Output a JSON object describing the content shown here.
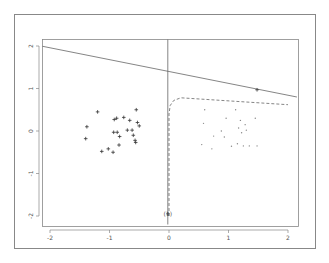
{
  "chart_data": {
    "type": "scatter",
    "title": "",
    "xlabel": "",
    "ylabel": "",
    "xlim": [
      -2.15,
      2.15
    ],
    "ylim": [
      -2.2,
      2.2
    ],
    "grid": false,
    "legend": null,
    "x_ticks": [
      -2,
      -1,
      0,
      1,
      2
    ],
    "x_tick_labels": [
      "-2",
      "-1",
      "0",
      "1",
      "2"
    ],
    "y_ticks": [
      -2,
      -1,
      0,
      1,
      2
    ],
    "y_tick_labels": [
      "-2",
      "-1",
      "0",
      "1",
      "2"
    ],
    "series": [
      {
        "name": "class-1",
        "marker": "plus",
        "color": "#333333",
        "points": [
          [
            -1.2,
            0.45
          ],
          [
            -1.38,
            0.1
          ],
          [
            -1.4,
            -0.18
          ],
          [
            -0.92,
            0.27
          ],
          [
            -0.88,
            0.3
          ],
          [
            -0.76,
            0.32
          ],
          [
            -0.66,
            0.25
          ],
          [
            -0.55,
            0.5
          ],
          [
            -0.53,
            0.2
          ],
          [
            -0.5,
            0.12
          ],
          [
            -0.93,
            -0.03
          ],
          [
            -0.87,
            -0.03
          ],
          [
            -0.83,
            -0.13
          ],
          [
            -0.7,
            0.02
          ],
          [
            -0.62,
            0.02
          ],
          [
            -0.6,
            -0.1
          ],
          [
            -0.57,
            -0.22
          ],
          [
            -0.56,
            -0.27
          ],
          [
            -1.13,
            -0.48
          ],
          [
            -1.02,
            -0.42
          ],
          [
            -0.94,
            -0.5
          ],
          [
            -0.84,
            -0.33
          ]
        ]
      },
      {
        "name": "class-2",
        "marker": "dot",
        "color": "#888888",
        "points": [
          [
            0.6,
            0.5
          ],
          [
            0.58,
            0.18
          ],
          [
            0.55,
            -0.32
          ],
          [
            0.72,
            -0.42
          ],
          [
            0.96,
            0.3
          ],
          [
            0.88,
            0.0
          ],
          [
            0.93,
            -0.14
          ],
          [
            1.12,
            0.5
          ],
          [
            1.2,
            0.25
          ],
          [
            1.17,
            0.07
          ],
          [
            1.22,
            -0.04
          ],
          [
            1.28,
            0.15
          ],
          [
            1.3,
            0.02
          ],
          [
            1.35,
            -0.35
          ],
          [
            1.25,
            -0.35
          ],
          [
            1.15,
            -0.3
          ],
          [
            1.05,
            -0.36
          ],
          [
            0.75,
            -0.12
          ],
          [
            1.45,
            0.3
          ],
          [
            1.48,
            -0.35
          ]
        ]
      },
      {
        "name": "special-points",
        "marker": "plus",
        "color": "#333333",
        "points": [
          [
            1.48,
            0.97
          ],
          [
            -0.02,
            -1.95
          ]
        ]
      }
    ],
    "lines": [
      {
        "name": "solid-boundary",
        "style": "solid",
        "color": "#666666",
        "points": [
          [
            -2.15,
            2.0
          ],
          [
            2.15,
            0.8
          ]
        ]
      },
      {
        "name": "dashed-boundary",
        "style": "dashed",
        "color": "#888888",
        "points": [
          [
            0.0,
            -2.0
          ],
          [
            0.0,
            0.4
          ],
          [
            0.02,
            0.6
          ],
          [
            0.08,
            0.72
          ],
          [
            0.2,
            0.78
          ],
          [
            2.0,
            0.62
          ]
        ]
      },
      {
        "name": "vertical-line",
        "style": "solid",
        "color": "#666666",
        "points": [
          [
            -0.02,
            2.2
          ],
          [
            -0.02,
            -2.2
          ]
        ]
      }
    ],
    "annotations": [
      {
        "text": "(1)",
        "x": -0.02,
        "y": -1.95
      }
    ]
  }
}
